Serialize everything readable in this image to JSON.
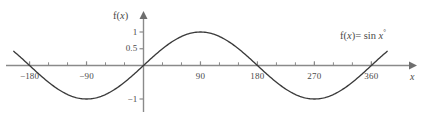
{
  "chart_data": {
    "type": "line",
    "title": "",
    "subtitle": "",
    "xlabel": "x",
    "ylabel": "f(x)",
    "annotation": "f(x) = sin x°",
    "annotation_parts": {
      "fname": "f",
      "open": "(",
      "var": "x",
      "close": ")",
      "equals": "=",
      "func": "sin",
      "arg": "x",
      "degree": "°"
    },
    "function": "sin(x degrees)",
    "xlim": [
      -205,
      385
    ],
    "ylim": [
      -1.35,
      1.25
    ],
    "grid": false,
    "legend": null,
    "x_ticks_major": [
      -180,
      -90,
      90,
      180,
      270,
      360
    ],
    "x_tick_labels": [
      "−180",
      "−90",
      "90",
      "180",
      "270",
      "360"
    ],
    "x_ticks_minor_step": 30,
    "y_ticks_major": [
      1,
      0.5,
      -1
    ],
    "y_tick_labels": [
      "1",
      "0.5",
      "−1"
    ],
    "x": [
      -205,
      -195,
      -185,
      -180,
      -170,
      -160,
      -150,
      -140,
      -130,
      -120,
      -110,
      -100,
      -90,
      -80,
      -70,
      -60,
      -50,
      -40,
      -30,
      -20,
      -10,
      0,
      10,
      20,
      30,
      40,
      50,
      60,
      70,
      80,
      90,
      100,
      110,
      120,
      130,
      140,
      150,
      160,
      170,
      180,
      190,
      200,
      210,
      220,
      230,
      240,
      250,
      260,
      270,
      280,
      290,
      300,
      310,
      320,
      330,
      340,
      350,
      360,
      370,
      380,
      385
    ],
    "y": [
      0.423,
      0.259,
      0.087,
      0.0,
      -0.174,
      -0.342,
      -0.5,
      -0.643,
      -0.766,
      -0.866,
      -0.94,
      -0.985,
      -1.0,
      -0.985,
      -0.94,
      -0.866,
      -0.766,
      -0.643,
      -0.5,
      -0.342,
      -0.174,
      0.0,
      0.174,
      0.342,
      0.5,
      0.643,
      0.766,
      0.866,
      0.94,
      0.985,
      1.0,
      0.985,
      0.94,
      0.866,
      0.766,
      0.643,
      0.5,
      0.342,
      0.174,
      0.0,
      -0.174,
      -0.342,
      -0.5,
      -0.643,
      -0.766,
      -0.866,
      -0.94,
      -0.985,
      -1.0,
      -0.985,
      -0.94,
      -0.866,
      -0.766,
      -0.643,
      -0.5,
      -0.342,
      -0.174,
      0.0,
      0.174,
      0.342,
      0.423
    ],
    "colors": {
      "curve": "#3a3a3a",
      "axis": "#8a8a8a",
      "tick": "#8a8a8a",
      "text": "#4a4a4a",
      "background": "#ffffff"
    }
  }
}
